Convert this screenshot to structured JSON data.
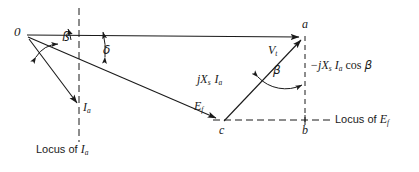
{
  "diagram": {
    "background": "#ffffff",
    "stroke": "#1a1a1a",
    "points": {
      "origin": "0",
      "a": "a",
      "b": "b",
      "c": "c"
    },
    "angles": {
      "beta_left": "ß",
      "delta": "δ",
      "beta_right": "β"
    },
    "phasors": {
      "terminal_voltage": "V",
      "terminal_voltage_sub": "t",
      "excitation_voltage": "E",
      "excitation_voltage_sub": "f",
      "armature_current": "I",
      "armature_current_sub": "a",
      "reactance_drop_prefix": "jX",
      "reactance_drop_sub": "s",
      "reactance_drop_current": "I",
      "reactance_drop_current_sub": "a",
      "projection_prefix": "−jX",
      "projection_sub": "s",
      "projection_current": "I",
      "projection_current_sub": "a",
      "projection_cos": "cos",
      "projection_angle": "β"
    },
    "loci": {
      "current": "Locus of",
      "current_symbol": "I",
      "current_symbol_sub": "a",
      "emf": "Locus of",
      "emf_symbol": "E",
      "emf_symbol_sub": "f"
    }
  }
}
